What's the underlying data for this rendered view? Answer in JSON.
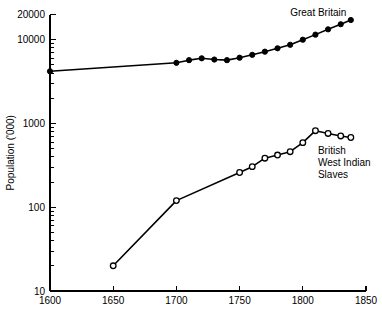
{
  "chart_data": {
    "type": "line",
    "title": "",
    "subtitle": "",
    "xlabel": "",
    "ylabel": "Population ('000)",
    "xlim": [
      1600,
      1850
    ],
    "ylim": [
      10,
      20000
    ],
    "yscale": "log",
    "xscale": "linear",
    "grid": false,
    "legend_position": "inline-annotation",
    "x_ticks": [
      1600,
      1650,
      1700,
      1750,
      1800,
      1850
    ],
    "x_tick_labels": [
      "1600",
      "1650",
      "1700",
      "1750",
      "1800",
      "1850"
    ],
    "y_ticks": [
      10,
      100,
      1000,
      10000,
      20000
    ],
    "y_tick_labels": [
      "10",
      "100",
      "1000",
      "10000",
      "20000"
    ],
    "y_minor_ticks": [
      20,
      30,
      40,
      50,
      60,
      70,
      80,
      90,
      200,
      300,
      400,
      500,
      600,
      700,
      800,
      900,
      2000,
      3000,
      4000,
      5000,
      6000,
      7000,
      8000,
      9000
    ],
    "series": [
      {
        "name": "Great Britain",
        "label": "Great Britain",
        "label_x": 1790,
        "label_y": 19000,
        "marker": "filled-circle",
        "points": [
          {
            "x": 1600,
            "y": 4200
          },
          {
            "x": 1700,
            "y": 5300
          },
          {
            "x": 1710,
            "y": 5700
          },
          {
            "x": 1720,
            "y": 6000
          },
          {
            "x": 1730,
            "y": 5800
          },
          {
            "x": 1740,
            "y": 5700
          },
          {
            "x": 1750,
            "y": 6100
          },
          {
            "x": 1760,
            "y": 6600
          },
          {
            "x": 1770,
            "y": 7200
          },
          {
            "x": 1780,
            "y": 7900
          },
          {
            "x": 1790,
            "y": 8700
          },
          {
            "x": 1800,
            "y": 10000
          },
          {
            "x": 1810,
            "y": 11500
          },
          {
            "x": 1820,
            "y": 13300
          },
          {
            "x": 1830,
            "y": 15300
          },
          {
            "x": 1838,
            "y": 17200
          }
        ]
      },
      {
        "name": "British West Indian Slaves",
        "label": "British\nWest Indian\nSlaves",
        "label_lines": [
          "British",
          "West Indian",
          "Slaves"
        ],
        "label_x": 1812,
        "label_y": 430,
        "marker": "open-circle",
        "points": [
          {
            "x": 1650,
            "y": 20
          },
          {
            "x": 1700,
            "y": 120
          },
          {
            "x": 1750,
            "y": 260
          },
          {
            "x": 1760,
            "y": 305
          },
          {
            "x": 1770,
            "y": 385
          },
          {
            "x": 1780,
            "y": 420
          },
          {
            "x": 1790,
            "y": 460
          },
          {
            "x": 1800,
            "y": 590
          },
          {
            "x": 1810,
            "y": 820
          },
          {
            "x": 1820,
            "y": 760
          },
          {
            "x": 1830,
            "y": 710
          },
          {
            "x": 1838,
            "y": 680
          }
        ]
      }
    ]
  },
  "accessibility": {
    "figure_name": "population-log-chart"
  },
  "colors": {
    "ink": "#000000",
    "paper": "#ffffff"
  }
}
